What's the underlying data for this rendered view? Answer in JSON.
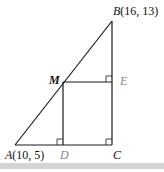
{
  "figure": {
    "type": "geometry-diagram",
    "colors": {
      "line": "#1a1a1a",
      "label_primary": "#111111",
      "label_secondary": "#888888",
      "bottom_bar": "#d4d4d4"
    },
    "points": {
      "A": {
        "name": "A",
        "coords": "(10, 5)"
      },
      "B": {
        "name": "B",
        "coords": "(16, 13)"
      },
      "C": {
        "name": "C",
        "coords": ""
      },
      "M": {
        "name": "M",
        "coords": ""
      },
      "D": {
        "name": "D",
        "coords": ""
      },
      "E": {
        "name": "E",
        "coords": ""
      }
    },
    "segments": [
      "AB",
      "BC",
      "AC",
      "MD",
      "ME"
    ],
    "right_angles": [
      "D",
      "C",
      "E"
    ]
  }
}
